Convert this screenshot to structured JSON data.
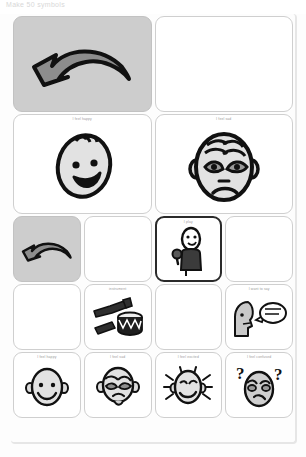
{
  "window": {
    "header_text": "Make 50 symbols"
  },
  "board": {
    "rows": [
      {
        "name": "navigation-row",
        "type": "two-col",
        "cells": [
          {
            "caption": "",
            "icon": "back-arrow-icon",
            "style": "gray",
            "selected": false
          },
          {
            "caption": "",
            "icon": "blank-icon",
            "style": "blank",
            "selected": false
          }
        ]
      },
      {
        "name": "feelings-row",
        "type": "two-col",
        "cells": [
          {
            "caption": "I feel happy",
            "icon": "happy-face-icon",
            "style": "white",
            "selected": false
          },
          {
            "caption": "I feel sad",
            "icon": "sad-face-icon",
            "style": "white",
            "selected": false
          }
        ]
      },
      {
        "name": "action-row",
        "type": "four-col",
        "cells": [
          {
            "caption": "",
            "icon": "back-arrow-icon",
            "style": "gray",
            "selected": false
          },
          {
            "caption": "",
            "icon": "blank-icon",
            "style": "blank",
            "selected": false
          },
          {
            "caption": "I play",
            "icon": "person-shaker-icon",
            "style": "white",
            "selected": true
          },
          {
            "caption": "",
            "icon": "blank-icon",
            "style": "blank",
            "selected": false
          }
        ]
      },
      {
        "name": "objects-row",
        "type": "four-col",
        "cells": [
          {
            "caption": "",
            "icon": "blank-icon",
            "style": "blank",
            "selected": false
          },
          {
            "caption": "instrument",
            "icon": "instruments-icon",
            "style": "white",
            "selected": false
          },
          {
            "caption": "",
            "icon": "blank-icon",
            "style": "blank",
            "selected": false
          },
          {
            "caption": "I want to say",
            "icon": "speech-head-icon",
            "style": "white",
            "selected": false
          }
        ]
      },
      {
        "name": "emotions-row",
        "type": "four-col",
        "cells": [
          {
            "caption": "I feel happy",
            "icon": "happy-face-icon",
            "style": "white",
            "selected": false
          },
          {
            "caption": "I feel sad",
            "icon": "sad-face-icon",
            "style": "white",
            "selected": false
          },
          {
            "caption": "I feel excited",
            "icon": "excited-face-icon",
            "style": "white",
            "selected": false
          },
          {
            "caption": "I feel confused",
            "icon": "confused-face-icon",
            "style": "white",
            "selected": false
          }
        ]
      }
    ]
  },
  "colors": {
    "cell_background": "#ffffff",
    "cell_border": "#cfcfcf",
    "gray_button": "#cdcdcd",
    "selected_border": "#2a2a2a",
    "caption_text": "#9a9a9a",
    "ink": "#1a1a1a"
  }
}
